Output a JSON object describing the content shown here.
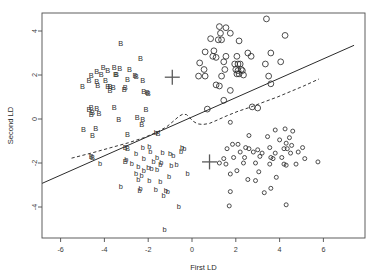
{
  "chart_data": {
    "type": "scatter",
    "title": "",
    "xlabel": "First LD",
    "ylabel": "Second LD",
    "xlim": [
      -6.9,
      7.4
    ],
    "ylim": [
      -5.4,
      4.7
    ],
    "xticks": [
      -6,
      -4,
      -2,
      0,
      2,
      4,
      6
    ],
    "xticklabels": [
      "-6",
      "-4",
      "-2",
      "0",
      "2",
      "4",
      "6"
    ],
    "yticks": [
      4,
      2,
      0,
      -2,
      -4
    ],
    "yticklabels": [
      "4",
      "2",
      "0",
      "-2",
      "-4"
    ],
    "grid": false,
    "legend": "none",
    "series": [
      {
        "name": "B",
        "marker": "letter-B-upper",
        "glyph": "B",
        "color": "#2e2e2e",
        "points": [
          [
            -3.25,
            3.45
          ],
          [
            -2.35,
            2.75
          ],
          [
            -4.05,
            2.35
          ],
          [
            -3.55,
            2.35
          ],
          [
            -4.35,
            2.15
          ],
          [
            -3.85,
            2.2
          ],
          [
            -3.3,
            2.3
          ],
          [
            -2.85,
            2.25
          ],
          [
            -4.6,
            2.0
          ],
          [
            -4.15,
            2.05
          ],
          [
            -3.5,
            2.05
          ],
          [
            -3.45,
            2.05
          ],
          [
            -2.6,
            2.0
          ],
          [
            -2.55,
            1.95
          ],
          [
            -4.7,
            1.75
          ],
          [
            -4.35,
            1.7
          ],
          [
            -3.95,
            1.75
          ],
          [
            -2.95,
            1.8
          ],
          [
            -2.25,
            1.75
          ],
          [
            -5.0,
            1.5
          ],
          [
            -4.3,
            1.55
          ],
          [
            -3.85,
            1.5
          ],
          [
            -3.75,
            1.5
          ],
          [
            -3.6,
            1.45
          ],
          [
            -3.05,
            1.45
          ],
          [
            -3.1,
            1.35
          ],
          [
            -3.75,
            1.3
          ],
          [
            -2.05,
            1.2
          ],
          [
            -2.0,
            1.15
          ],
          [
            -2.2,
            1.25
          ],
          [
            -4.6,
            0.55
          ],
          [
            -4.7,
            0.45
          ],
          [
            -4.35,
            0.5
          ],
          [
            -4.55,
            0.3
          ],
          [
            -4.6,
            0.2
          ],
          [
            -4.25,
            0.25
          ],
          [
            -3.55,
            0.55
          ],
          [
            -2.1,
            0.45
          ],
          [
            -3.35,
            0.0
          ],
          [
            -2.5,
            0.1
          ],
          [
            -2.25,
            0.0
          ],
          [
            -4.95,
            -0.45
          ],
          [
            -4.4,
            -0.4
          ],
          [
            -4.55,
            -0.75
          ],
          [
            -2.3,
            -0.25
          ],
          [
            -1.55,
            -0.65
          ],
          [
            -2.95,
            -0.7
          ],
          [
            -3.05,
            -1.3
          ],
          [
            -2.95,
            -1.35
          ],
          [
            -4.55,
            -1.75
          ],
          [
            -4.6,
            -1.7
          ],
          [
            -3.05,
            -1.9
          ]
        ]
      },
      {
        "name": "b",
        "marker": "letter-b-lower",
        "glyph": "b",
        "color": "#2e2e2e",
        "points": [
          [
            -1.65,
            -0.6
          ],
          [
            -2.25,
            -1.3
          ],
          [
            -1.95,
            -1.25
          ],
          [
            -0.45,
            -1.3
          ],
          [
            -0.35,
            -1.35
          ],
          [
            -0.5,
            -1.45
          ],
          [
            -2.55,
            -1.55
          ],
          [
            -1.9,
            -1.45
          ],
          [
            -1.35,
            -1.5
          ],
          [
            -1.0,
            -1.55
          ],
          [
            -0.85,
            -1.65
          ],
          [
            -1.6,
            -1.75
          ],
          [
            -2.2,
            -1.8
          ],
          [
            -3.0,
            -1.85
          ],
          [
            -2.75,
            -2.0
          ],
          [
            -1.75,
            -1.9
          ],
          [
            -1.4,
            -1.95
          ],
          [
            -1.45,
            -2.05
          ],
          [
            -0.95,
            -2.1
          ],
          [
            -0.7,
            -2.05
          ],
          [
            -2.45,
            -2.15
          ],
          [
            -2.0,
            -2.2
          ],
          [
            -1.85,
            -2.25
          ],
          [
            -1.6,
            -2.3
          ],
          [
            -2.2,
            -2.35
          ],
          [
            -2.55,
            -2.45
          ],
          [
            -4.2,
            -2.0
          ],
          [
            -0.2,
            -2.45
          ],
          [
            -2.3,
            -2.55
          ],
          [
            -1.05,
            -2.6
          ],
          [
            -2.45,
            -2.75
          ],
          [
            -1.95,
            -2.8
          ],
          [
            -1.45,
            -2.85
          ],
          [
            -3.25,
            -3.05
          ],
          [
            -2.35,
            -3.15
          ],
          [
            -2.4,
            -3.25
          ],
          [
            -1.65,
            -3.2
          ],
          [
            -1.2,
            -3.25
          ],
          [
            -1.1,
            -3.3
          ],
          [
            -1.3,
            -3.45
          ],
          [
            -0.6,
            -3.95
          ],
          [
            -1.25,
            -5.0
          ]
        ]
      },
      {
        "name": "O",
        "marker": "circle-large",
        "radius": 2.9,
        "color": "#2e2e2e",
        "points": [
          [
            3.4,
            4.55
          ],
          [
            1.25,
            4.2
          ],
          [
            1.55,
            4.15
          ],
          [
            1.3,
            3.9
          ],
          [
            1.75,
            3.9
          ],
          [
            0.85,
            3.65
          ],
          [
            1.2,
            3.6
          ],
          [
            1.35,
            3.6
          ],
          [
            2.15,
            3.55
          ],
          [
            4.25,
            3.8
          ],
          [
            0.6,
            3.05
          ],
          [
            1.0,
            3.1
          ],
          [
            2.55,
            3.0
          ],
          [
            3.6,
            3.0
          ],
          [
            0.95,
            2.85
          ],
          [
            1.1,
            2.8
          ],
          [
            1.55,
            2.85
          ],
          [
            2.05,
            2.85
          ],
          [
            2.7,
            2.85
          ],
          [
            0.35,
            2.55
          ],
          [
            1.45,
            2.6
          ],
          [
            1.95,
            2.5
          ],
          [
            2.1,
            2.5
          ],
          [
            2.2,
            2.5
          ],
          [
            3.35,
            2.5
          ],
          [
            4.05,
            2.6
          ],
          [
            0.55,
            2.25
          ],
          [
            1.5,
            2.25
          ],
          [
            2.0,
            2.25
          ],
          [
            2.1,
            2.2
          ],
          [
            2.25,
            2.25
          ],
          [
            2.3,
            2.2
          ],
          [
            0.3,
            1.95
          ],
          [
            0.6,
            1.95
          ],
          [
            1.35,
            1.95
          ],
          [
            2.05,
            2.05
          ],
          [
            2.15,
            2.05
          ],
          [
            2.35,
            2.0
          ],
          [
            3.5,
            1.95
          ],
          [
            1.1,
            1.55
          ],
          [
            1.25,
            1.5
          ],
          [
            1.75,
            1.3
          ],
          [
            3.6,
            1.6
          ],
          [
            1.45,
            0.85
          ],
          [
            0.7,
            0.45
          ],
          [
            2.75,
            0.55
          ],
          [
            3.0,
            0.5
          ]
        ]
      },
      {
        "name": "o",
        "marker": "circle-small",
        "radius": 2.0,
        "color": "#2e2e2e",
        "points": [
          [
            1.75,
            -0.15
          ],
          [
            3.8,
            -0.5
          ],
          [
            4.25,
            -0.45
          ],
          [
            4.6,
            -0.55
          ],
          [
            2.6,
            -0.75
          ],
          [
            3.45,
            -0.8
          ],
          [
            4.45,
            -0.85
          ],
          [
            4.0,
            -0.95
          ],
          [
            1.85,
            -1.15
          ],
          [
            2.1,
            -1.15
          ],
          [
            4.3,
            -1.1
          ],
          [
            4.55,
            -1.2
          ],
          [
            1.6,
            -1.35
          ],
          [
            2.45,
            -1.3
          ],
          [
            2.6,
            -1.35
          ],
          [
            3.0,
            -1.4
          ],
          [
            3.55,
            -1.3
          ],
          [
            4.2,
            -1.35
          ],
          [
            4.35,
            -1.35
          ],
          [
            5.05,
            -1.3
          ],
          [
            2.2,
            -1.5
          ],
          [
            2.8,
            -1.5
          ],
          [
            3.2,
            -1.55
          ],
          [
            3.8,
            -1.55
          ],
          [
            4.5,
            -1.55
          ],
          [
            4.85,
            -1.5
          ],
          [
            1.45,
            -1.8
          ],
          [
            1.9,
            -1.75
          ],
          [
            2.4,
            -1.75
          ],
          [
            3.1,
            -1.7
          ],
          [
            3.6,
            -1.75
          ],
          [
            3.7,
            -1.8
          ],
          [
            4.1,
            -1.75
          ],
          [
            5.15,
            -1.8
          ],
          [
            5.75,
            -1.95
          ],
          [
            1.25,
            -2.0
          ],
          [
            1.55,
            -2.05
          ],
          [
            2.35,
            -2.0
          ],
          [
            2.9,
            -2.0
          ],
          [
            3.55,
            -2.05
          ],
          [
            4.2,
            -2.05
          ],
          [
            4.3,
            -2.1
          ],
          [
            4.75,
            -2.05
          ],
          [
            2.05,
            -2.35
          ],
          [
            1.75,
            -2.5
          ],
          [
            3.05,
            -2.4
          ],
          [
            2.55,
            -2.75
          ],
          [
            2.9,
            -2.8
          ],
          [
            3.85,
            -2.65
          ],
          [
            3.6,
            -3.15
          ],
          [
            1.75,
            -3.3
          ],
          [
            3.3,
            -3.35
          ],
          [
            4.3,
            -3.9
          ],
          [
            1.7,
            -3.95
          ]
        ]
      }
    ],
    "centroids": [
      {
        "name": "centroid-upper",
        "x": -0.9,
        "y": 1.9
      },
      {
        "name": "centroid-lower",
        "x": 0.8,
        "y": -1.95
      }
    ],
    "annotations": [
      {
        "name": "decision-boundary-solid",
        "style": "solid",
        "points": [
          [
            -6.9,
            -2.95
          ],
          [
            7.4,
            3.35
          ]
        ]
      },
      {
        "name": "decision-boundary-dashed",
        "style": "dashed",
        "points": [
          [
            -5.5,
            -1.78
          ],
          [
            -4.6,
            -1.55
          ],
          [
            -3.7,
            -1.3
          ],
          [
            -2.9,
            -1.08
          ],
          [
            -2.2,
            -0.85
          ],
          [
            -1.6,
            -0.6
          ],
          [
            -1.15,
            -0.35
          ],
          [
            -0.85,
            -0.1
          ],
          [
            -0.6,
            0.12
          ],
          [
            -0.42,
            0.22
          ],
          [
            -0.25,
            0.2
          ],
          [
            -0.1,
            0.05
          ],
          [
            0.05,
            -0.1
          ],
          [
            0.25,
            -0.22
          ],
          [
            0.5,
            -0.25
          ],
          [
            0.8,
            -0.2
          ],
          [
            1.15,
            -0.05
          ],
          [
            1.6,
            0.15
          ],
          [
            2.1,
            0.35
          ],
          [
            2.7,
            0.55
          ],
          [
            3.3,
            0.78
          ],
          [
            3.9,
            1.0
          ],
          [
            4.5,
            1.25
          ],
          [
            5.1,
            1.5
          ],
          [
            5.8,
            1.82
          ]
        ]
      }
    ]
  }
}
